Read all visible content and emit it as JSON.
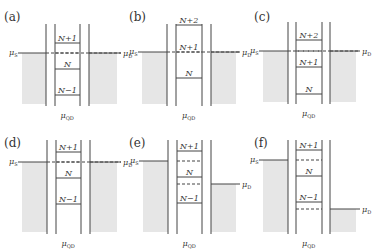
{
  "figure": {
    "panels": [
      {
        "id": "a",
        "label": "(a)",
        "ox": 0,
        "oy": 0,
        "barriers": [
          46,
          55,
          80,
          89
        ],
        "top": 24,
        "bottom": 106,
        "source_level": 53,
        "drain_level": 53,
        "source_left": 22,
        "drain_right": 117,
        "levels": [
          {
            "y": 43,
            "text": "N+1",
            "style": "solid"
          },
          {
            "y": 53,
            "text": "",
            "style": "dashed"
          },
          {
            "y": 69,
            "text": "N",
            "style": "solid"
          },
          {
            "y": 95,
            "text": "N−1",
            "style": "solid"
          }
        ],
        "mu_s": "μS",
        "mu_d": "μD",
        "mu_qd": "μQD"
      },
      {
        "id": "b",
        "label": "(b)",
        "ox": 125,
        "oy": 0,
        "barriers": [
          42,
          51,
          77,
          86
        ],
        "top": 24,
        "bottom": 106,
        "source_level": 52,
        "drain_level": 52,
        "source_left": 17,
        "drain_right": 111,
        "levels": [
          {
            "y": 25,
            "text": "N+2",
            "style": "solid"
          },
          {
            "y": 52,
            "text": "N+1",
            "style": "dashed"
          },
          {
            "y": 78,
            "text": "N",
            "style": "solid"
          }
        ],
        "mu_s": "μS",
        "mu_d": "μD",
        "mu_qd": "μQD"
      },
      {
        "id": "c",
        "label": "(c)",
        "ox": 250,
        "oy": 0,
        "barriers": [
          38,
          46,
          72,
          80
        ],
        "top": 22,
        "bottom": 104,
        "source_level": 51,
        "drain_level": 51,
        "source_left": 13,
        "drain_right": 106,
        "levels": [
          {
            "y": 40,
            "text": "N+2",
            "style": "solid"
          },
          {
            "y": 51,
            "text": "",
            "style": "dashed"
          },
          {
            "y": 67,
            "text": "N+1",
            "style": "solid"
          },
          {
            "y": 94,
            "text": "N",
            "style": "solid"
          }
        ],
        "mu_s": "μS",
        "mu_d": "μD",
        "mu_qd": "μQD"
      },
      {
        "id": "d",
        "label": "(d)",
        "ox": 0,
        "oy": 126,
        "barriers": [
          47,
          56,
          81,
          90
        ],
        "top": 14,
        "bottom": 108,
        "source_level": 36,
        "drain_level": 36,
        "source_left": 22,
        "drain_right": 117,
        "levels": [
          {
            "y": 26,
            "text": "N+1",
            "style": "solid"
          },
          {
            "y": 36,
            "text": "",
            "style": "dashed"
          },
          {
            "y": 52,
            "text": "N",
            "style": "solid"
          },
          {
            "y": 78,
            "text": "N−1",
            "style": "solid"
          }
        ],
        "mu_s": "μS",
        "mu_d": "μD",
        "mu_qd": "μQD"
      },
      {
        "id": "e",
        "label": "(e)",
        "ox": 125,
        "oy": 126,
        "barriers": [
          43,
          52,
          77,
          86
        ],
        "top": 14,
        "bottom": 108,
        "source_level": 35,
        "drain_level": 58,
        "source_left": 18,
        "drain_right": 111,
        "levels": [
          {
            "y": 25,
            "text": "N+1",
            "style": "solid"
          },
          {
            "y": 35,
            "text": "",
            "style": "dashed"
          },
          {
            "y": 51,
            "text": "N",
            "style": "solid"
          },
          {
            "y": 58,
            "text": "",
            "style": "dashed"
          },
          {
            "y": 77,
            "text": "N−1",
            "style": "solid"
          }
        ],
        "mu_s": "μS",
        "mu_d": "μD",
        "mu_qd": "μQD"
      },
      {
        "id": "f",
        "label": "(f)",
        "ox": 250,
        "oy": 126,
        "barriers": [
          38,
          46,
          72,
          80
        ],
        "top": 14,
        "bottom": 108,
        "source_level": 34,
        "drain_level": 83,
        "source_left": 13,
        "drain_right": 106,
        "levels": [
          {
            "y": 24,
            "text": "N+1",
            "style": "solid"
          },
          {
            "y": 34,
            "text": "",
            "style": "dashed"
          },
          {
            "y": 50,
            "text": "N",
            "style": "solid"
          },
          {
            "y": 76,
            "text": "N−1",
            "style": "solid"
          },
          {
            "y": 83,
            "text": "",
            "style": "dashed"
          }
        ],
        "mu_s": "μS",
        "mu_d": "μD",
        "mu_qd": "μQD"
      }
    ]
  },
  "colors": {
    "line": "#444444",
    "fill": "#e6e6e6",
    "text": "#333333"
  }
}
